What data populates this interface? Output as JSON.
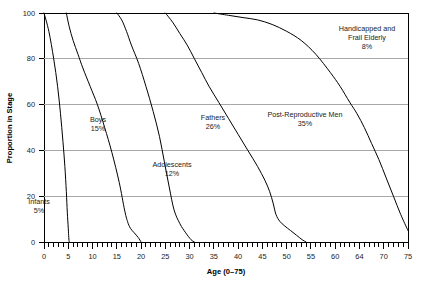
{
  "chart_data": {
    "type": "line",
    "title": "",
    "subtitle": "",
    "xlabel": "Age (0–75)",
    "ylabel": "Proportion in Stage",
    "xlim": [
      0,
      75
    ],
    "ylim": [
      0,
      100
    ],
    "grid": true,
    "grid_axis": "y",
    "legend_position": "none",
    "legend_entries": [],
    "background_color": "#ffffff",
    "line_color": "#000000",
    "grid_color": "#a8a8a8",
    "x_tick_labels": [
      "0",
      "5",
      "10",
      "15",
      "20",
      "25",
      "30",
      "35",
      "40",
      "45",
      "50",
      "55",
      "60",
      "64",
      "70",
      "75"
    ],
    "x_tick_values": [
      0,
      5,
      10,
      15,
      20,
      25,
      30,
      35,
      40,
      45,
      50,
      55,
      60,
      64,
      70,
      75
    ],
    "x_minor_tick_interval": 1,
    "y_tick_labels": [
      "0",
      "20",
      "40",
      "60",
      "80",
      "100"
    ],
    "y_tick_values": [
      0,
      20,
      40,
      60,
      80,
      100
    ],
    "series": [
      {
        "name": "Infants",
        "label": "Infants",
        "percent_label": "5%",
        "annotation_x": 3.0,
        "annotation_y": 14.0,
        "x": [
          0,
          1.0,
          2.0,
          2.8,
          3.4,
          3.9,
          4.3,
          4.6,
          4.8,
          5.0,
          5.1,
          5.2
        ],
        "y": [
          100,
          92,
          80,
          68,
          56,
          44,
          33,
          22,
          13,
          6,
          2,
          0
        ]
      },
      {
        "name": "Boys",
        "label": "Boys",
        "percent_label": "15%",
        "annotation_x": 12.0,
        "annotation_y": 52.0,
        "x": [
          4.6,
          5.2,
          6.0,
          7.0,
          8.0,
          9.5,
          11.0,
          12.5,
          14.0,
          15.5,
          16.6,
          17.2,
          17.8,
          18.6,
          19.4,
          20.0
        ],
        "y": [
          100,
          94,
          88,
          82,
          76,
          68,
          60,
          50,
          39,
          26,
          14,
          9,
          6,
          4,
          2,
          0
        ]
      },
      {
        "name": "Adolescents",
        "label": "Adolescents",
        "percent_label": "12%",
        "annotation_x": 20.5,
        "annotation_y": 31.0,
        "x": [
          15.0,
          16.0,
          17.0,
          18.0,
          19.5,
          21.0,
          22.5,
          23.8,
          24.8,
          25.8,
          26.8,
          28.0,
          29.2,
          30.3,
          31.0
        ],
        "y": [
          100,
          97,
          92,
          86,
          78,
          68,
          57,
          46,
          35,
          24,
          14,
          8,
          4,
          1,
          0
        ]
      },
      {
        "name": "Fathers",
        "label": "Fathers",
        "percent_label": "26%",
        "annotation_x": 35.0,
        "annotation_y": 52.0,
        "x": [
          25.0,
          26.5,
          28.0,
          29.5,
          31.0,
          32.5,
          34.0,
          36.0,
          38.0,
          40.0,
          42.0,
          44.0,
          45.5,
          46.5,
          47.2,
          47.8,
          48.6,
          49.6,
          50.8,
          52.0,
          53.2,
          54.0
        ],
        "y": [
          100,
          96,
          91,
          86,
          80,
          74,
          68,
          61,
          54,
          47,
          40,
          33,
          27,
          22,
          17,
          12,
          9,
          7,
          5,
          3,
          1,
          0
        ]
      },
      {
        "name": "Post-Reproductive Men",
        "label": "Post-Reproductive Men",
        "percent_label": "35%",
        "annotation_x": 55.5,
        "annotation_y": 54.0,
        "x": [
          35.0,
          38.0,
          41.0,
          44.0,
          47.0,
          50.0,
          53.0,
          56.0,
          59.0,
          61.0,
          63.0,
          64.5,
          66.0,
          67.5,
          69.0,
          70.5,
          72.0,
          73.5,
          75.0
        ],
        "y": [
          100,
          99,
          98,
          97,
          95,
          92,
          88,
          82,
          74,
          68,
          61,
          56,
          50,
          43,
          36,
          28,
          20,
          12,
          5
        ]
      },
      {
        "name": "Handicapped and Frail Elderly",
        "label": "Handicapped and Frail Elderly",
        "percent_label": "8%",
        "annotation_x": 63.5,
        "annotation_y": 90.0,
        "x": [],
        "y": []
      }
    ],
    "annotations": [
      {
        "text": "Infants",
        "sub": "5%"
      },
      {
        "text": "Boys",
        "sub": "15%"
      },
      {
        "text": "Adolescents",
        "sub": "12%"
      },
      {
        "text": "Fathers",
        "sub": "26%"
      },
      {
        "text": "Post-Reproductive Men",
        "sub": "35%"
      },
      {
        "text": "Handicapped and",
        "text2": "Frail Elderly",
        "sub": "8%"
      }
    ]
  },
  "axes": {
    "x_title": "Age (0–75)",
    "y_title": "Proportion in Stage"
  },
  "xticks": {
    "t0": "0",
    "t1": "5",
    "t2": "10",
    "t3": "15",
    "t4": "20",
    "t5": "25",
    "t6": "30",
    "t7": "35",
    "t8": "40",
    "t9": "45",
    "t10": "50",
    "t11": "55",
    "t12": "60",
    "t13": "64",
    "t14": "70",
    "t15": "75"
  },
  "yticks": {
    "t0": "0",
    "t1": "20",
    "t2": "40",
    "t3": "60",
    "t4": "80",
    "t5": "100"
  },
  "labels": {
    "infants_name": "Infants",
    "infants_pct": "5%",
    "boys_name": "Boys",
    "boys_pct": "15%",
    "adolescents_name": "Adolescents",
    "adolescents_pct": "12%",
    "fathers_name": "Fathers",
    "fathers_pct": "26%",
    "postrep_name": "Post-Reproductive Men",
    "postrep_pct": "35%",
    "elderly_name_line1": "Handicapped and",
    "elderly_name_line2": "Frail Elderly",
    "elderly_pct": "8%"
  }
}
